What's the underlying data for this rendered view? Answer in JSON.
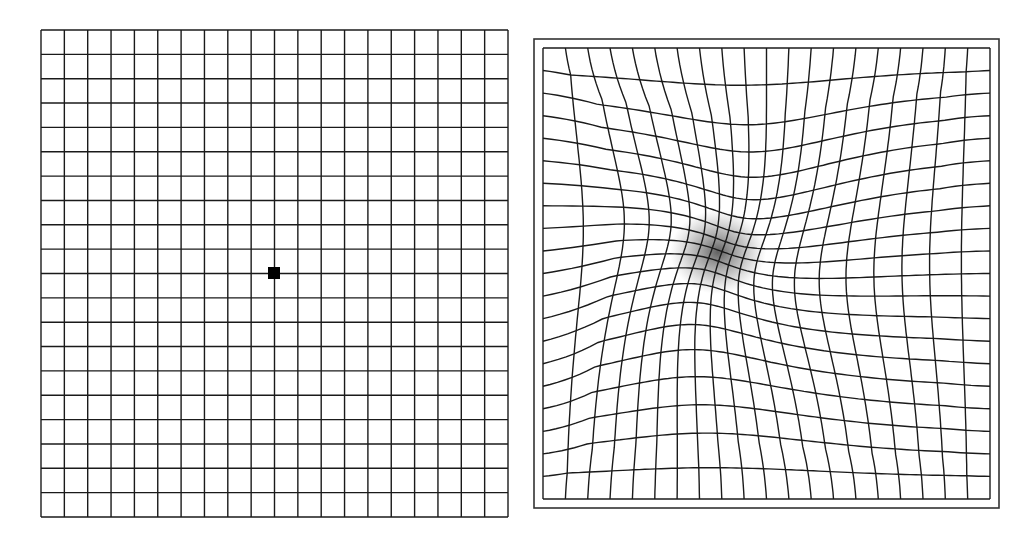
{
  "figure": {
    "background": "#ffffff",
    "line_color": "#1a1a1a",
    "normal_grid": {
      "label": "Normal Amsler grid",
      "x": 41,
      "y": 30,
      "width": 467,
      "height": 487,
      "columns": 20,
      "rows": 20,
      "fixation_dot": {
        "cx": 274,
        "cy": 273,
        "size": 12,
        "color": "#000000"
      }
    },
    "distorted_grid": {
      "label": "Amsler grid as seen with macular degeneration (metamorphopsia)",
      "frame": {
        "x": 534,
        "y": 39,
        "width": 465,
        "height": 469
      },
      "x": 543,
      "y": 48,
      "width": 447,
      "height": 451,
      "columns": 20,
      "rows": 20,
      "distortion_center": {
        "cx": 722,
        "cy": 252
      },
      "distortion_strength": 0.55,
      "distortion_radius": 110,
      "scotoma": {
        "cx": 718,
        "cy": 252,
        "rx": 48,
        "ry": 42,
        "color": "#555555"
      }
    }
  }
}
